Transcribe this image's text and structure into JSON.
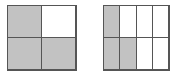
{
  "canvas": {
    "width": 179,
    "height": 78,
    "background_color": "#ffffff"
  },
  "style": {
    "shaded_fill_color": "#c2c2c2",
    "unshaded_fill_color": "#ffffff",
    "line_color": "#555555",
    "line_width_px": 1
  },
  "chart_data": {
    "type": "table",
    "title": "",
    "subtitle": "",
    "xlabel": "",
    "ylabel": "",
    "legend": [],
    "annotations": [],
    "figures": [
      {
        "name": "left-figure",
        "label": "",
        "rows": 2,
        "columns": 2,
        "total_cells": 4,
        "shaded_count": 3,
        "unshaded_count": 1,
        "fraction_shaded": "3/4",
        "fraction_value": 0.75,
        "shaded_cells": [
          "row1-col1",
          "row2-col1",
          "row2-col2"
        ],
        "cells": [
          {
            "id": "row1-col1",
            "row": 1,
            "column": 1,
            "shaded": true
          },
          {
            "id": "row1-col2",
            "row": 1,
            "column": 2,
            "shaded": false
          },
          {
            "id": "row2-col1",
            "row": 2,
            "column": 1,
            "shaded": true
          },
          {
            "id": "row2-col2",
            "row": 2,
            "column": 2,
            "shaded": true
          }
        ]
      },
      {
        "name": "right-figure",
        "label": "",
        "rows": 2,
        "columns": 4,
        "total_cells": 8,
        "shaded_count": 3,
        "unshaded_count": 5,
        "fraction_shaded": "3/8",
        "fraction_value": 0.375,
        "shaded_cells": [
          "row1-col1",
          "row2-col1",
          "row2-col2"
        ],
        "cells": [
          {
            "id": "row1-col1",
            "row": 1,
            "column": 1,
            "shaded": true
          },
          {
            "id": "row1-col2",
            "row": 1,
            "column": 2,
            "shaded": false
          },
          {
            "id": "row1-col3",
            "row": 1,
            "column": 3,
            "shaded": false
          },
          {
            "id": "row1-col4",
            "row": 1,
            "column": 4,
            "shaded": false
          },
          {
            "id": "row2-col1",
            "row": 2,
            "column": 1,
            "shaded": true
          },
          {
            "id": "row2-col2",
            "row": 2,
            "column": 2,
            "shaded": true
          },
          {
            "id": "row2-col3",
            "row": 2,
            "column": 3,
            "shaded": false
          },
          {
            "id": "row2-col4",
            "row": 2,
            "column": 4,
            "shaded": false
          }
        ]
      }
    ]
  }
}
